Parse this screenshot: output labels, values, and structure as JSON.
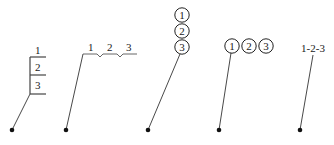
{
  "diagram": {
    "figures": [
      {
        "style": "stacked-table",
        "labels": [
          "1",
          "2",
          "3"
        ]
      },
      {
        "style": "horizontal-underline-with-notches",
        "labels": [
          "1",
          "2",
          "3"
        ]
      },
      {
        "style": "vertical-stacked-circles",
        "labels": [
          "1",
          "2",
          "3"
        ]
      },
      {
        "style": "horizontal-circles",
        "labels": [
          "1",
          "2",
          "3"
        ]
      },
      {
        "style": "dash-joined-text",
        "labels": [
          "1-2-3"
        ]
      }
    ],
    "colors": {
      "line": "#333333",
      "dot": "#111111",
      "background": "#ffffff"
    }
  }
}
